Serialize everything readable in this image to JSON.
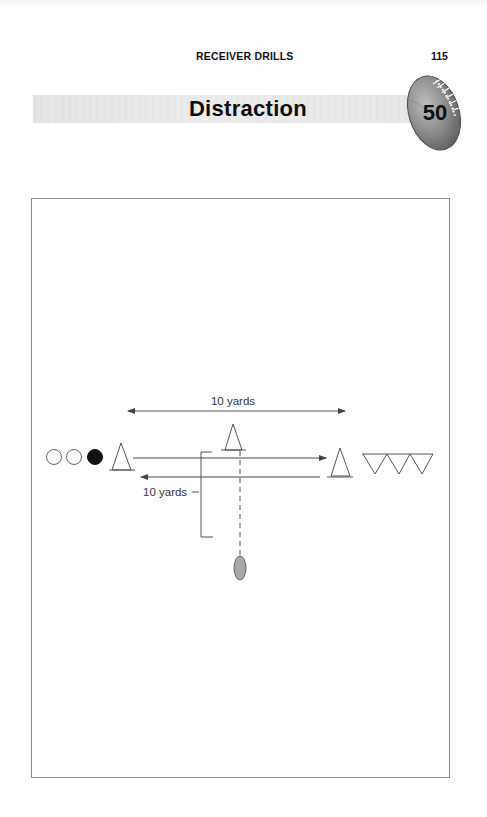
{
  "page": {
    "running_head": "RECEIVER DRILLS",
    "page_number": "115",
    "title": "Distraction",
    "drill_number": "50"
  },
  "diagram": {
    "top_dimension_label": "10 yards",
    "side_dimension_label": "10 yards",
    "players": [
      {
        "type": "receiver",
        "filled": false
      },
      {
        "type": "receiver",
        "filled": false
      },
      {
        "type": "receiver",
        "filled": true
      }
    ],
    "cones": [
      "start-cone",
      "middle-cone",
      "end-cone"
    ],
    "defenders_count": 3,
    "ball": "football-pass",
    "routes": [
      {
        "direction": "right",
        "label": "out-route"
      },
      {
        "direction": "left",
        "label": "return-route"
      }
    ],
    "colors": {
      "line": "#555555",
      "ball_fill": "#a9a9a9",
      "box_border": "#8a8a8a",
      "title_band": "#e6e6e6"
    }
  }
}
